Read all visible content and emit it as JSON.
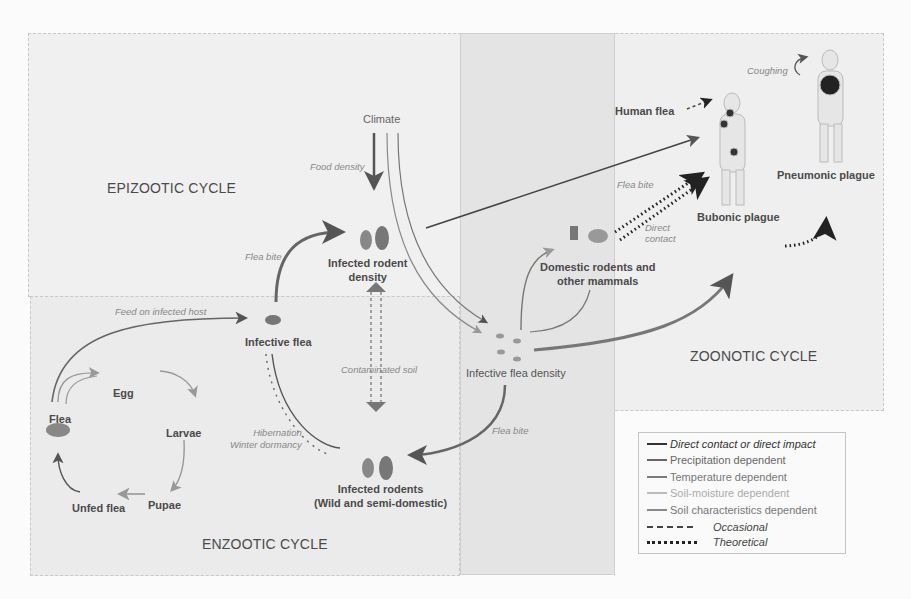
{
  "regions": {
    "epizootic": "EPIZOOTIC CYCLE",
    "enzootic": "ENZOOTIC CYCLE",
    "zoonotic": "ZOONOTIC CYCLE"
  },
  "nodes": {
    "climate": "Climate",
    "infected_rodent_density_1": "Infected rodent",
    "infected_rodent_density_2": "density",
    "infective_flea": "Infective flea",
    "infective_flea_density": "Infective flea density",
    "infected_rodents_1": "Infected rodents",
    "infected_rodents_2": "(Wild and semi-domestic)",
    "domestic_1": "Domestic rodents and",
    "domestic_2": "other mammals",
    "human_flea": "Human flea",
    "bubonic": "Bubonic plague",
    "pneumonic": "Pneumonic plague",
    "flea": "Flea",
    "egg": "Egg",
    "larvae": "Larvae",
    "pupae": "Pupae",
    "unfed_flea": "Unfed flea"
  },
  "edge_labels": {
    "food_density": "Food density",
    "flea_bite_top": "Flea bite",
    "feed_on_infected_host": "Feed on infected host",
    "contaminated_soil": "Contaminated soil",
    "hibernation": "Hibernation",
    "winter_dormancy": "Winter dormancy",
    "flea_bite_bottom": "Flea bite",
    "flea_bite_zoonotic": "Flea bite",
    "direct": "Direct",
    "contact": "contact",
    "coughing": "Coughing"
  },
  "legend": {
    "items": [
      {
        "label": "Direct contact or direct impact",
        "color": "#333333",
        "style": "solid",
        "italic": true
      },
      {
        "label": "Precipitation dependent",
        "color": "#666666",
        "style": "solid",
        "italic": false
      },
      {
        "label": "Temperature dependent",
        "color": "#7a7a7a",
        "style": "solid",
        "italic": false
      },
      {
        "label": "Soil-moisture dependent",
        "color": "#b0b0b0",
        "style": "solid",
        "italic": false
      },
      {
        "label": "Soil characteristics dependent",
        "color": "#8a8a8a",
        "style": "solid",
        "italic": false
      },
      {
        "label": "Occasional",
        "color": "#444444",
        "style": "dashed",
        "italic": true
      },
      {
        "label": "Theoretical",
        "color": "#222222",
        "style": "dotted",
        "italic": true
      }
    ]
  },
  "colors": {
    "arrow_dark": "#555555",
    "arrow_mid": "#777777",
    "arrow_light": "#aaaaaa"
  }
}
